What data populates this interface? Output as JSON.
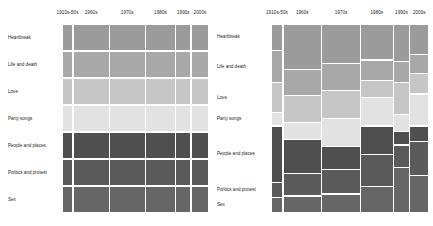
{
  "figure": {
    "title": "",
    "panels": [
      "left-uniform-grid",
      "right-mosaic"
    ]
  },
  "columns": [
    "1910s-50s",
    "1960s",
    "1970s",
    "1980s",
    "1990s",
    "2000s"
  ],
  "rows": [
    "Heartbreak",
    "Life and death",
    "Love",
    "Party songs",
    "People and places",
    "Politics and protest",
    "Sex"
  ],
  "row_colors": [
    "#9b9b9b",
    "#a8a8a8",
    "#c6c6c6",
    "#e2e2e2",
    "#4f4f4f",
    "#5a5a5a",
    "#666666"
  ],
  "background": "#ffffff",
  "gap_color": "#ffffff",
  "chart_data": [
    {
      "type": "heatmap",
      "name": "left-panel",
      "title": "",
      "xlabel": "",
      "ylabel": "",
      "categories": [
        "1910s-50s",
        "1960s",
        "1970s",
        "1980s",
        "1990s",
        "2000s"
      ],
      "rows": [
        "Heartbreak",
        "Life and death",
        "Love",
        "Party songs",
        "People and places",
        "Politics and protest",
        "Sex"
      ],
      "note": "Uniform row heights; column widths proportional to decade song counts.",
      "column_widths": [
        8,
        26,
        26,
        22,
        11,
        13
      ],
      "row_heights": [
        14.3,
        14.3,
        14.3,
        14.3,
        14.3,
        14.3,
        14.3
      ],
      "series": [
        {
          "name": "Heartbreak",
          "values": [
            8,
            26,
            26,
            22,
            11,
            13
          ]
        },
        {
          "name": "Life and death",
          "values": [
            8,
            26,
            26,
            22,
            11,
            13
          ]
        },
        {
          "name": "Love",
          "values": [
            8,
            26,
            26,
            22,
            11,
            13
          ]
        },
        {
          "name": "Party songs",
          "values": [
            8,
            26,
            26,
            22,
            11,
            13
          ]
        },
        {
          "name": "People and places",
          "values": [
            8,
            26,
            26,
            22,
            11,
            13
          ]
        },
        {
          "name": "Politics and protest",
          "values": [
            8,
            26,
            26,
            22,
            11,
            13
          ]
        },
        {
          "name": "Sex",
          "values": [
            8,
            26,
            26,
            22,
            11,
            13
          ]
        }
      ],
      "grid": false,
      "legend": "none"
    },
    {
      "type": "heatmap",
      "name": "right-panel",
      "title": "",
      "xlabel": "",
      "ylabel": "",
      "categories": [
        "1910s-50s",
        "1960s",
        "1970s",
        "1980s",
        "1990s",
        "2000s"
      ],
      "rows": [
        "Heartbreak",
        "Life and death",
        "Love",
        "Party songs",
        "People and places",
        "Politics and protest",
        "Sex"
      ],
      "note": "Full mosaic: column widths proportional to decade totals; within each column, row heights proportional to theme share.",
      "column_widths": [
        8,
        26,
        26,
        22,
        11,
        13
      ],
      "series": [
        {
          "name": "Heartbreak",
          "values": [
            14,
            24,
            21,
            19,
            20,
            16
          ]
        },
        {
          "name": "Life and death",
          "values": [
            17,
            14,
            14,
            11,
            11,
            10
          ]
        },
        {
          "name": "Love",
          "values": [
            16,
            14,
            15,
            9,
            17,
            11
          ]
        },
        {
          "name": "Party songs",
          "values": [
            7,
            9,
            15,
            15,
            9,
            17
          ]
        },
        {
          "name": "People and places",
          "values": [
            30,
            18,
            12,
            15,
            7,
            8
          ]
        },
        {
          "name": "Politics and protest",
          "values": [
            8,
            12,
            13,
            17,
            12,
            18
          ]
        },
        {
          "name": "Sex",
          "values": [
            8,
            9,
            10,
            14,
            24,
            20
          ]
        }
      ],
      "grid": false,
      "legend": "none"
    }
  ]
}
